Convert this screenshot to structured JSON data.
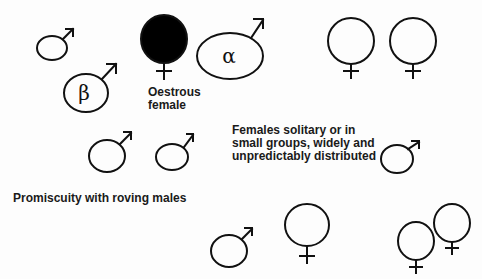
{
  "labels": {
    "oestrous": [
      "Oestrous",
      "female"
    ],
    "females_note": [
      "Females solitary or in",
      "small groups, widely and",
      "unpredictably distributed"
    ],
    "promiscuity": "Promiscuity with roving males"
  },
  "symbols": {
    "alpha": "α",
    "beta": "β"
  },
  "colors": {
    "stroke": "#111111",
    "oestrous_fill": "#000000",
    "background": "#fdfdfd"
  }
}
